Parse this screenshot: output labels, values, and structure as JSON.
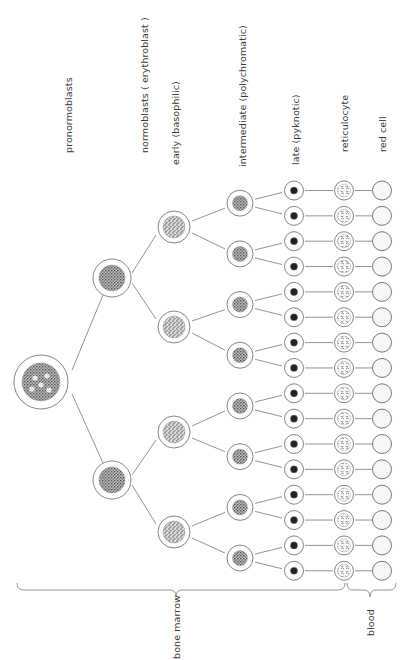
{
  "diagram": {
    "column_labels": {
      "pronormoblasts": "pronormoblasts",
      "normoblasts": "normoblasts ( erythroblast )",
      "early": "early (basophilic)",
      "intermediate": "intermediate (polychromatic)",
      "late": "late (pyknotic)",
      "reticulocyte": "reticulocyte",
      "red_cell": "red cell"
    },
    "region_labels": {
      "bone_marrow": "bone marrow",
      "blood": "blood"
    },
    "stages": [
      {
        "name": "pronormoblast",
        "count": 1
      },
      {
        "name": "normoblast",
        "count": 2
      },
      {
        "name": "early (basophilic)",
        "count": 4
      },
      {
        "name": "intermediate (polychromatic)",
        "count": 8
      },
      {
        "name": "late (pyknotic)",
        "count": 16
      },
      {
        "name": "reticulocyte",
        "count": 16
      },
      {
        "name": "red cell",
        "count": 16
      }
    ],
    "colors": {
      "line": "#777777",
      "nucleus_dark": "#222222",
      "nucleus_speckle": "#555555"
    }
  }
}
